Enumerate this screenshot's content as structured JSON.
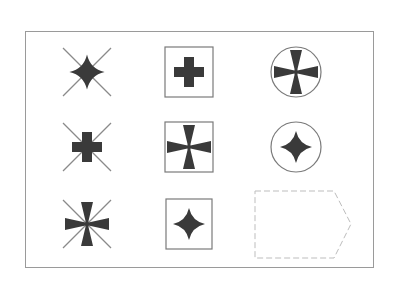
{
  "puzzle": {
    "type": "3x3 figure matrix",
    "colors": {
      "ink": "#3a3a3a",
      "line": "#8a8a8a",
      "frame": "#9a9a9a",
      "answer_outline": "#bdbdbd"
    },
    "cells": [
      {
        "row": 1,
        "col": 1,
        "frame": "x-lines",
        "symbol": "four-point-star"
      },
      {
        "row": 1,
        "col": 2,
        "frame": "square",
        "symbol": "plus-cross"
      },
      {
        "row": 1,
        "col": 3,
        "frame": "circle",
        "symbol": "pattee-cross"
      },
      {
        "row": 2,
        "col": 1,
        "frame": "x-lines",
        "symbol": "plus-cross"
      },
      {
        "row": 2,
        "col": 2,
        "frame": "square",
        "symbol": "pattee-cross"
      },
      {
        "row": 2,
        "col": 3,
        "frame": "circle",
        "symbol": "four-point-star"
      },
      {
        "row": 3,
        "col": 1,
        "frame": "x-lines",
        "symbol": "pattee-cross"
      },
      {
        "row": 3,
        "col": 2,
        "frame": "square",
        "symbol": "four-point-star"
      },
      {
        "row": 3,
        "col": 3,
        "frame": "answer-placeholder",
        "symbol": "missing"
      }
    ]
  }
}
